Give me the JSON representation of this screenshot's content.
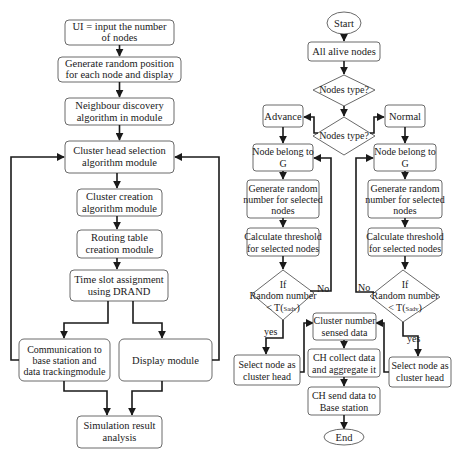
{
  "left_flow": {
    "boxes": [
      {
        "id": "ui-input",
        "lines": [
          "UI = input the number",
          "of nodes"
        ]
      },
      {
        "id": "generate-position",
        "lines": [
          "Generate random position",
          "for each node and display"
        ]
      },
      {
        "id": "neighbour-discovery",
        "lines": [
          "Neighbour discovery",
          "algorithm in module"
        ]
      },
      {
        "id": "cluster-head-selection",
        "lines": [
          "Cluster head selection",
          "algorithm module"
        ]
      },
      {
        "id": "cluster-creation",
        "lines": [
          "Cluster creation",
          "algorithm module"
        ]
      },
      {
        "id": "routing-table",
        "lines": [
          "Routing table",
          "creation module"
        ]
      },
      {
        "id": "time-slot",
        "lines": [
          "Time slot assignment",
          "using DRAND"
        ]
      },
      {
        "id": "communication",
        "lines": [
          "Communication to",
          "base station and",
          "data trackingmodule"
        ]
      },
      {
        "id": "display-module",
        "lines": [
          "Display module"
        ]
      },
      {
        "id": "simulation-result",
        "lines": [
          "Simulation result",
          "analysis"
        ]
      }
    ]
  },
  "right_flow": {
    "start": "Start",
    "all_alive": "All alive nodes",
    "decision1": "Nodes type?",
    "decision2": "Nodes type?",
    "advance": "Advance",
    "normal": "Normal",
    "left_branch": {
      "belong": [
        "Node belong to",
        "G"
      ],
      "generate": [
        "Generate random",
        "number for selected",
        "nodes"
      ],
      "threshold": [
        "Calculate threshold",
        "for selected nodes"
      ],
      "decision": {
        "if": "If",
        "random": "Random number",
        "cond_prefix": "< T(",
        "cond_sub": "Sadv",
        "cond_suffix": ")"
      },
      "no_label": "No",
      "yes_label": "yes",
      "select": [
        "Select node as",
        "cluster head"
      ]
    },
    "right_branch": {
      "belong": [
        "Node belong to",
        "G"
      ],
      "generate": [
        "Generate random",
        "number for selected",
        "nodes"
      ],
      "threshold": [
        "Calculate threshold",
        "for selected nodes"
      ],
      "decision": {
        "if": "If",
        "random": "Random number",
        "cond_prefix": "< T(",
        "cond_sub": "Sadv",
        "cond_suffix": ")"
      },
      "no_label": "No",
      "yes_label": "yes",
      "select": [
        "Select node as",
        "cluster head"
      ]
    },
    "cluster_number": [
      "Cluster number",
      "sensed data"
    ],
    "ch_collect": [
      "CH collect data",
      "and aggregate it"
    ],
    "ch_send": [
      "CH send data to",
      "Base station"
    ],
    "end": "End"
  }
}
